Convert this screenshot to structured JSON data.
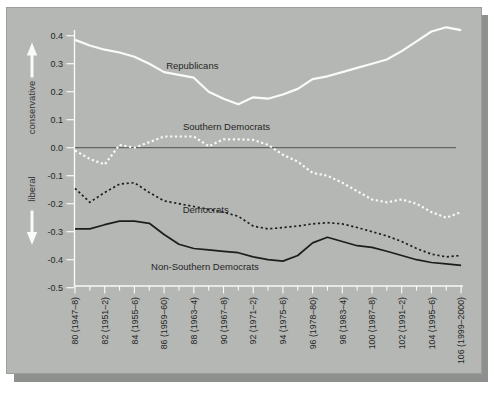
{
  "colors": {
    "page_bg": "#ffffff",
    "panel_bg": "#b4b7b3",
    "panel_border": "#9b9e9a",
    "shadow": "#8d908c",
    "white_line": "#fafaf7",
    "dark_line": "#1d1d1d",
    "zero_line": "#4f4f4f",
    "text": "#262626"
  },
  "chart_data": {
    "type": "line",
    "title": "",
    "xlabel": "",
    "ylabel": "",
    "grid": false,
    "legend_position": "inline-annotations",
    "ylim": [
      -0.5,
      0.45
    ],
    "y_ticks": [
      "0.4",
      "0.3",
      "0.2",
      "0.1",
      "0.0",
      "-0.1",
      "-0.2",
      "-0.3",
      "-0.4",
      "-0.5"
    ],
    "y_arrow_labels": {
      "up": "conservative",
      "down": "liberal"
    },
    "x": [
      80,
      81,
      82,
      83,
      84,
      85,
      86,
      87,
      88,
      89,
      90,
      91,
      92,
      93,
      94,
      95,
      96,
      97,
      98,
      99,
      100,
      101,
      102,
      103,
      104,
      105,
      106
    ],
    "x_tick_labels": [
      {
        "congress": 80,
        "label": "80 (1947–8)"
      },
      {
        "congress": 82,
        "label": "82 (1951–2)"
      },
      {
        "congress": 84,
        "label": "84 (1955–6)"
      },
      {
        "congress": 86,
        "label": "86 (1959–60)"
      },
      {
        "congress": 88,
        "label": "88 (1963–4)"
      },
      {
        "congress": 90,
        "label": "90 (1967–8)"
      },
      {
        "congress": 92,
        "label": "92 (1971–2)"
      },
      {
        "congress": 94,
        "label": "94 (1975–6)"
      },
      {
        "congress": 96,
        "label": "96 (1978–80)"
      },
      {
        "congress": 98,
        "label": "98 (1983–4)"
      },
      {
        "congress": 100,
        "label": "100 (1987–8)"
      },
      {
        "congress": 102,
        "label": "102 (1991–2)"
      },
      {
        "congress": 104,
        "label": "104 (1995–6)"
      },
      {
        "congress": 106,
        "label": "106 (1999–2000)"
      }
    ],
    "series": [
      {
        "name": "Republicans",
        "color": "white",
        "style": "solid",
        "values": [
          0.385,
          0.365,
          0.35,
          0.34,
          0.325,
          0.3,
          0.27,
          0.26,
          0.25,
          0.2,
          0.175,
          0.155,
          0.18,
          0.175,
          0.19,
          0.21,
          0.245,
          0.255,
          0.27,
          0.285,
          0.3,
          0.315,
          0.345,
          0.38,
          0.415,
          0.43,
          0.42
        ]
      },
      {
        "name": "Southern Democrats",
        "color": "white",
        "style": "dotted",
        "values": [
          -0.01,
          -0.04,
          -0.06,
          0.01,
          0.0,
          0.02,
          0.04,
          0.04,
          0.04,
          0.005,
          0.03,
          0.03,
          0.028,
          0.01,
          -0.025,
          -0.05,
          -0.09,
          -0.1,
          -0.125,
          -0.155,
          -0.185,
          -0.195,
          -0.185,
          -0.2,
          -0.23,
          -0.25,
          -0.23
        ]
      },
      {
        "name": "Democrats",
        "color": "black",
        "style": "dotted",
        "values": [
          -0.145,
          -0.195,
          -0.16,
          -0.13,
          -0.125,
          -0.16,
          -0.19,
          -0.2,
          -0.21,
          -0.22,
          -0.23,
          -0.245,
          -0.28,
          -0.29,
          -0.285,
          -0.28,
          -0.272,
          -0.268,
          -0.272,
          -0.285,
          -0.3,
          -0.315,
          -0.335,
          -0.36,
          -0.38,
          -0.39,
          -0.385
        ]
      },
      {
        "name": "Non-Southern Democrats",
        "color": "black",
        "style": "solid",
        "values": [
          -0.29,
          -0.29,
          -0.275,
          -0.262,
          -0.262,
          -0.27,
          -0.31,
          -0.345,
          -0.36,
          -0.365,
          -0.37,
          -0.375,
          -0.39,
          -0.4,
          -0.405,
          -0.385,
          -0.34,
          -0.32,
          -0.335,
          -0.35,
          -0.356,
          -0.37,
          -0.385,
          -0.4,
          -0.41,
          -0.415,
          -0.42
        ]
      }
    ],
    "annotations": [
      {
        "text": "Republicans",
        "congress": 87.9,
        "value": 0.292
      },
      {
        "text": "Southern Democrats",
        "congress": 90.2,
        "value": 0.074
      },
      {
        "text": "Democrats",
        "congress": 88.8,
        "value": -0.222
      },
      {
        "text": "Non-Southern Democrats",
        "congress": 88.75,
        "value": -0.426
      }
    ]
  }
}
